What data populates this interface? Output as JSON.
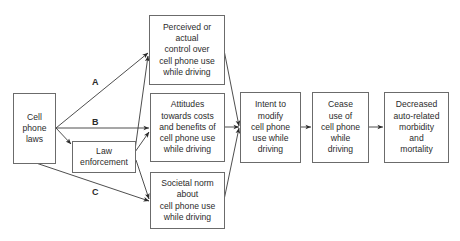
{
  "diagram": {
    "type": "flowchart",
    "nodes": [
      {
        "id": "laws",
        "text": "Cell\nphone\nlaws"
      },
      {
        "id": "enforcement",
        "text": "Law\nenforcement"
      },
      {
        "id": "control",
        "text": "Perceived or\nactual\ncontrol over\ncell phone use\nwhile driving"
      },
      {
        "id": "attitudes",
        "text": "Attitudes\ntowards costs\nand benefits of\ncell phone use\nwhile driving"
      },
      {
        "id": "norm",
        "text": "Societal norm\nabout\ncell phone use\nwhile driving"
      },
      {
        "id": "intent",
        "text": "Intent to\nmodify\ncell phone\nuse while\ndriving"
      },
      {
        "id": "cease",
        "text": "Cease\nuse of\ncell phone\nwhile\ndriving"
      },
      {
        "id": "outcome",
        "text": "Decreased\nauto-related\nmorbidity\nand\nmortality"
      }
    ],
    "edge_labels": {
      "A": "A",
      "B": "B",
      "C": "C"
    },
    "edges": [
      {
        "from": "laws",
        "to": "control",
        "label": "A"
      },
      {
        "from": "laws",
        "to": "attitudes",
        "label": "B"
      },
      {
        "from": "laws",
        "to": "enforcement"
      },
      {
        "from": "laws",
        "to": "norm",
        "label": "C"
      },
      {
        "from": "enforcement",
        "to": "control"
      },
      {
        "from": "enforcement",
        "to": "attitudes"
      },
      {
        "from": "enforcement",
        "to": "norm"
      },
      {
        "from": "control",
        "to": "intent"
      },
      {
        "from": "attitudes",
        "to": "intent"
      },
      {
        "from": "norm",
        "to": "intent"
      },
      {
        "from": "intent",
        "to": "cease"
      },
      {
        "from": "cease",
        "to": "outcome"
      }
    ],
    "colors": {
      "line": "#3a3a3a",
      "box_border": "#6b6b6b",
      "text": "#2b2b2b",
      "background": "#ffffff"
    }
  }
}
